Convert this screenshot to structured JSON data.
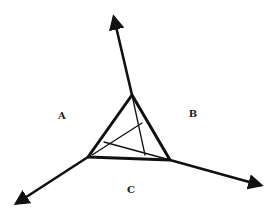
{
  "diagram": {
    "type": "triangle-with-three-outward-arrows",
    "stroke_color": "#111111",
    "background": "#ffffff",
    "regions": [
      {
        "id": "A",
        "label": "A",
        "x": 62,
        "y": 116
      },
      {
        "id": "B",
        "label": "B",
        "x": 193,
        "y": 114
      },
      {
        "id": "C",
        "label": "C",
        "x": 131,
        "y": 190
      }
    ],
    "triangle": {
      "vertices": [
        {
          "name": "top",
          "x": 132,
          "y": 95
        },
        {
          "name": "bottom-left",
          "x": 88,
          "y": 157
        },
        {
          "name": "bottom-right",
          "x": 170,
          "y": 160
        }
      ]
    },
    "arrows": [
      {
        "name": "up",
        "from": {
          "x": 132,
          "y": 95
        },
        "to": {
          "x": 114,
          "y": 18
        }
      },
      {
        "name": "down-left",
        "from": {
          "x": 88,
          "y": 157
        },
        "to": {
          "x": 17,
          "y": 203
        }
      },
      {
        "name": "down-right",
        "from": {
          "x": 170,
          "y": 160
        },
        "to": {
          "x": 260,
          "y": 185
        }
      }
    ],
    "inner_lines": [
      {
        "from": {
          "x": 132,
          "y": 95
        },
        "to": {
          "x": 145,
          "y": 155
        }
      },
      {
        "from": {
          "x": 92,
          "y": 155
        },
        "to": {
          "x": 142,
          "y": 123
        }
      },
      {
        "from": {
          "x": 104,
          "y": 142
        },
        "to": {
          "x": 170,
          "y": 160
        }
      }
    ]
  }
}
